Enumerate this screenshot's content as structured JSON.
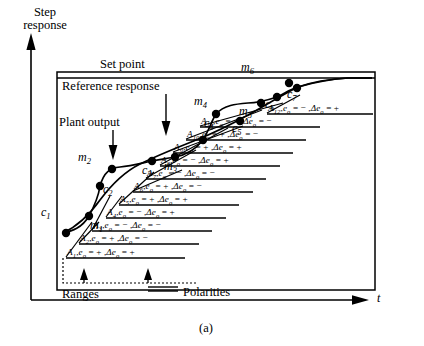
{
  "figure": {
    "caption": "(a)",
    "y_axis_label_line1": "Step",
    "y_axis_label_line2": "response",
    "x_axis_label": "t"
  },
  "callouts": {
    "set_point": "Set point",
    "reference_response": "Reference response",
    "plant_output": "Plant output",
    "ranges": "Ranges",
    "polarities": "Polarities"
  },
  "point_labels": {
    "c": [
      {
        "name": "c",
        "sub": "1"
      },
      {
        "name": "c",
        "sub": "2"
      },
      {
        "name": "c",
        "sub": "3"
      },
      {
        "name": "c",
        "sub": "4"
      },
      {
        "name": "c",
        "sub": "5"
      },
      {
        "name": "c",
        "sub": "6"
      },
      {
        "name": "c",
        "sub": "7"
      }
    ],
    "m": [
      {
        "name": "m",
        "sub": "1"
      },
      {
        "name": "m",
        "sub": "2"
      },
      {
        "name": "m",
        "sub": "3"
      },
      {
        "name": "m",
        "sub": "4"
      },
      {
        "name": "m",
        "sub": "5"
      },
      {
        "name": "m",
        "sub": "6"
      }
    ]
  },
  "annotations": [
    {
      "id": "A",
      "sub": "1",
      "eo": "+",
      "deo": "+"
    },
    {
      "id": "A",
      "sub": "2",
      "eo": "+",
      "deo": "−"
    },
    {
      "id": "A",
      "sub": "3",
      "eo": "−",
      "deo": "−"
    },
    {
      "id": "A",
      "sub": "4",
      "eo": "−",
      "deo": "+"
    },
    {
      "id": "A",
      "sub": "5",
      "eo": "+",
      "deo": "+"
    },
    {
      "id": "A",
      "sub": "6",
      "eo": "+",
      "deo": "−"
    },
    {
      "id": "A",
      "sub": "7",
      "eo": "−",
      "deo": "−"
    },
    {
      "id": "A",
      "sub": "8",
      "eo": "−",
      "deo": "+"
    },
    {
      "id": "A",
      "sub": "9",
      "eo": "+",
      "deo": "+"
    },
    {
      "id": "A",
      "sub": "10",
      "eo": "+",
      "deo": "−"
    },
    {
      "id": "A",
      "sub": "11",
      "eo": "−",
      "deo": "−"
    },
    {
      "id": "A",
      "sub": "12",
      "eo": "−",
      "deo": "+"
    }
  ],
  "chart_data": {
    "type": "line",
    "title": "",
    "xlabel": "t",
    "ylabel": "Step response",
    "grid": false,
    "legend": "none",
    "series": [
      {
        "name": "Plant output",
        "x": [
          63,
          69,
          78,
          88,
          100,
          113,
          128,
          143,
          160,
          178,
          196,
          214,
          232,
          250,
          268,
          286,
          300,
          315,
          330
        ],
        "y": [
          233,
          229,
          222,
          207,
          186,
          170,
          160,
          155,
          152,
          148,
          140,
          128,
          116,
          105,
          97,
          90,
          84,
          80,
          78
        ]
      },
      {
        "name": "Reference response",
        "x": [
          63,
          78,
          95,
          112,
          130,
          150,
          170,
          190,
          210,
          230,
          250,
          270,
          290,
          310,
          330,
          350,
          370
        ],
        "y": [
          233,
          224,
          208,
          191,
          176,
          164,
          154,
          146,
          138,
          130,
          122,
          113,
          103,
          94,
          86,
          80,
          78
        ]
      }
    ],
    "set_point_value": 78,
    "markers_c": [
      {
        "label": "c1",
        "x": 66,
        "y": 233
      },
      {
        "label": "c2",
        "x": 100,
        "y": 186
      },
      {
        "label": "c3",
        "x": 152,
        "y": 161
      },
      {
        "label": "c4",
        "x": 203,
        "y": 140
      },
      {
        "label": "c5",
        "x": 240,
        "y": 121
      },
      {
        "label": "c6",
        "x": 277,
        "y": 97
      },
      {
        "label": "c7",
        "x": 297,
        "y": 88
      }
    ],
    "markers_m": [
      {
        "label": "m1",
        "x": 89,
        "y": 216
      },
      {
        "label": "m2",
        "x": 112,
        "y": 169
      },
      {
        "label": "m3",
        "x": 175,
        "y": 157
      },
      {
        "label": "m4",
        "x": 216,
        "y": 114
      },
      {
        "label": "m5",
        "x": 261,
        "y": 103
      },
      {
        "label": "m6",
        "x": 289,
        "y": 83
      }
    ]
  }
}
